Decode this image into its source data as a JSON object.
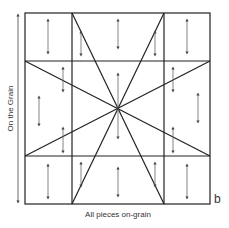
{
  "labels": {
    "side": "On the Grain",
    "bottom": "All pieces on-grain",
    "letter_b": "b",
    "letter_a": "a"
  },
  "colors": {
    "line": "#222222",
    "arrow": "#555555"
  }
}
